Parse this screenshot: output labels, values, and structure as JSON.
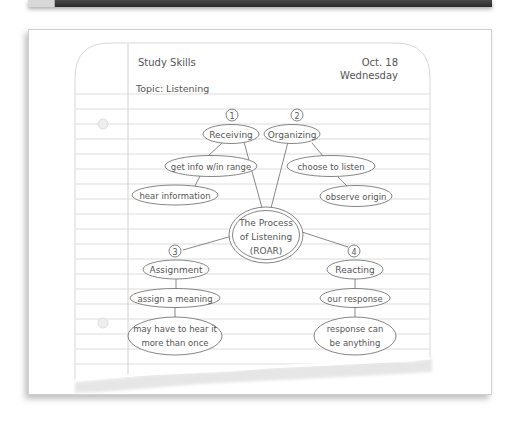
{
  "header": {
    "subject": "Study Skills",
    "date_line1": "Oct. 18",
    "date_line2": "Wednesday",
    "topic": "Topic: Listening"
  },
  "diagram": {
    "center": {
      "line1": "The Process",
      "line2": "of Listening",
      "line3": "(ROAR)"
    },
    "steps": [
      {
        "number": "1",
        "label": "Receiving",
        "details": [
          "get info w/in range",
          "hear information"
        ]
      },
      {
        "number": "2",
        "label": "Organizing",
        "details": [
          "choose to listen",
          "observe origin"
        ]
      },
      {
        "number": "3",
        "label": "Assignment",
        "details": [
          "assign a meaning",
          "may have to hear it",
          "more than once"
        ]
      },
      {
        "number": "4",
        "label": "Reacting",
        "details": [
          "our response",
          "response can",
          "be anything"
        ]
      }
    ]
  },
  "colors": {
    "ink": "#555555",
    "rule": "#d6d6d6",
    "margin": "#d0d0d0"
  }
}
